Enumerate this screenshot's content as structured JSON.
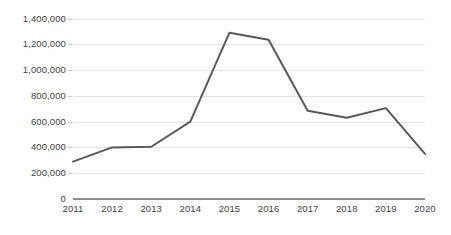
{
  "chart_data": {
    "type": "line",
    "title": "",
    "subtitle": "",
    "xlabel": "",
    "ylabel": "",
    "categories": [
      "2011",
      "2012",
      "2013",
      "2014",
      "2015",
      "2016",
      "2017",
      "2018",
      "2019",
      "2020"
    ],
    "values": [
      290000,
      400000,
      405000,
      600000,
      1290000,
      1235000,
      685000,
      630000,
      705000,
      350000
    ],
    "series": [
      {
        "name": "",
        "values": [
          290000,
          400000,
          405000,
          600000,
          1290000,
          1235000,
          685000,
          630000,
          705000,
          350000
        ]
      }
    ],
    "ylim": [
      0,
      1400000
    ],
    "y_tick_values": [
      0,
      200000,
      400000,
      600000,
      800000,
      1000000,
      1200000,
      1400000
    ],
    "y_tick_labels": [
      "0",
      "200,000",
      "400,000",
      "600,000",
      "800,000",
      "1,000,000",
      "1,200,000",
      "1,400,000"
    ],
    "x_tick_labels": [
      "2011",
      "2012",
      "2013",
      "2014",
      "2015",
      "2016",
      "2017",
      "2018",
      "2019",
      "2020"
    ],
    "grid": true,
    "grid_axis": "y",
    "legend": false,
    "legend_position": "none",
    "markers": false,
    "line_color": "#595959",
    "gridline_color": "#e4e4e4",
    "axis_color": "#8d8d8d",
    "text_color": "#3f3f3f",
    "background_color": "#ffffff",
    "annotations": []
  }
}
